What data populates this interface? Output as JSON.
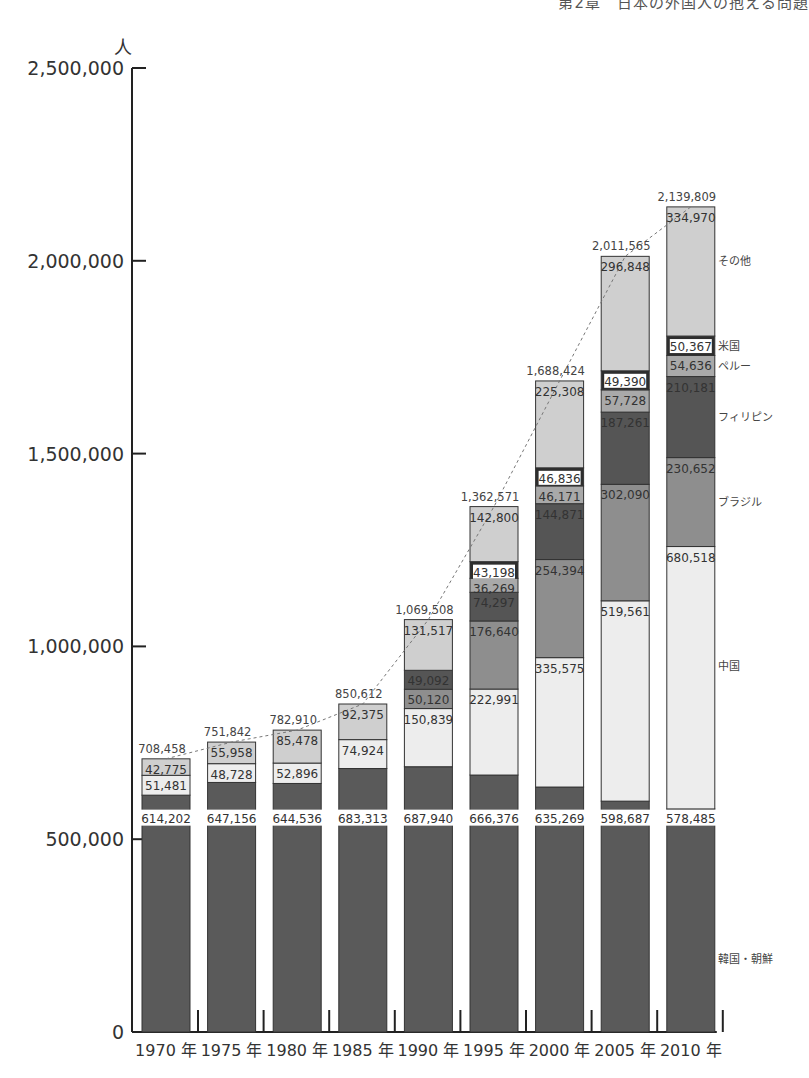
{
  "header": {
    "title": "第2章　日本の外国人の抱える問題"
  },
  "chart_data": {
    "type": "bar",
    "stacked": true,
    "title": "",
    "ylabel": "人",
    "xlabel": "",
    "ylim": [
      0,
      2500000
    ],
    "yticks": [
      0,
      500000,
      1000000,
      1500000,
      2000000,
      2500000
    ],
    "ytick_labels": [
      "0",
      "500,000",
      "1,000,000",
      "1,500,000",
      "2,000,000",
      "2,500,000"
    ],
    "grid": false,
    "legend_position": "right (labels beside 2010 bar)",
    "categories": [
      "1970 年",
      "1975 年",
      "1980 年",
      "1985 年",
      "1990 年",
      "1995 年",
      "2000 年",
      "2005 年",
      "2010 年"
    ],
    "totals": [
      708458,
      751842,
      782910,
      850612,
      1069508,
      1362571,
      1688424,
      2011565,
      2139809
    ],
    "total_labels": [
      "708,458",
      "751,842",
      "782,910",
      "850,612",
      "1,069,508",
      "1,362,571",
      "1,688,424",
      "2,011,565",
      "2,139,809"
    ],
    "series": [
      {
        "name": "韓国・朝鮮",
        "color": "#5a5a5a",
        "values": [
          614202,
          647156,
          644536,
          683313,
          687940,
          666376,
          635269,
          598687,
          578485
        ],
        "labels": [
          "614,202",
          "647,156",
          "644,536",
          "683,313",
          "687,940",
          "666,376",
          "635,269",
          "598,687",
          "578,485"
        ]
      },
      {
        "name": "中国",
        "color": "#ededed",
        "values": [
          51481,
          48728,
          52896,
          74924,
          150839,
          222991,
          335575,
          519561,
          680518
        ],
        "labels": [
          "51,481",
          "48,728",
          "52,896",
          "74,924",
          "150,839",
          "222,991",
          "335,575",
          "519,561",
          "680,518"
        ]
      },
      {
        "name": "ブラジル",
        "color": "#8e8e8e",
        "values": [
          0,
          0,
          0,
          0,
          50120,
          176640,
          254394,
          302090,
          230652
        ],
        "labels": [
          "",
          "",
          "",
          "",
          "50,120",
          "176,640",
          "254,394",
          "302,090",
          "230,652"
        ]
      },
      {
        "name": "フィリピン",
        "color": "#555555",
        "values": [
          0,
          0,
          0,
          0,
          49092,
          74297,
          144871,
          187261,
          210181
        ],
        "labels": [
          "",
          "",
          "",
          "",
          "49,092",
          "74,297",
          "144,871",
          "187,261",
          "210,181"
        ]
      },
      {
        "name": "ペルー",
        "color": "#a9a9a9",
        "values": [
          0,
          0,
          0,
          0,
          0,
          36269,
          46171,
          57728,
          54636
        ],
        "labels": [
          "",
          "",
          "",
          "",
          "",
          "36,269",
          "46,171",
          "57,728",
          "54,636"
        ]
      },
      {
        "name": "米国",
        "color": "#2e2e2e",
        "values": [
          0,
          0,
          0,
          0,
          0,
          43198,
          46836,
          49390,
          50367
        ],
        "labels": [
          "",
          "",
          "",
          "",
          "",
          "43,198",
          "46,836",
          "49,390",
          "50,367"
        ]
      },
      {
        "name": "その他",
        "color": "#cfcfcf",
        "values": [
          42775,
          55958,
          85478,
          92375,
          131517,
          142800,
          225308,
          296848,
          334970
        ],
        "labels": [
          "42,775",
          "55,958",
          "85,478",
          "92,375",
          "131,517",
          "142,800",
          "225,308",
          "296,848",
          "334,970"
        ]
      }
    ],
    "trend_line": "dashed line connecting bar totals"
  }
}
